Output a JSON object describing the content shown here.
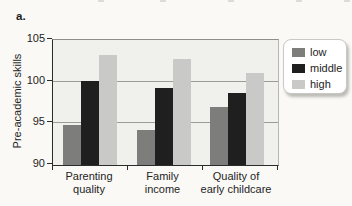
{
  "figure": {
    "panel_label": "a."
  },
  "chart_data": {
    "type": "bar",
    "title": "",
    "xlabel": "",
    "ylabel": "Pre-academic skills",
    "ylim": [
      90,
      105
    ],
    "yticks": [
      90,
      95,
      100,
      105
    ],
    "gridlines": [
      95,
      100
    ],
    "grid": "horizontal",
    "legend_position": "right",
    "plot_bg": "#f0f0ed",
    "categories": [
      "Parenting quality",
      "Family income",
      "Quality of early childcare"
    ],
    "category_label_lines": [
      [
        "Parenting",
        "quality"
      ],
      [
        "Family",
        "income"
      ],
      [
        "Quality of",
        "early childcare"
      ]
    ],
    "series": [
      {
        "name": "low",
        "color": "#7d7d7b",
        "values": [
          94.8,
          94.2,
          97.0
        ]
      },
      {
        "name": "middle",
        "color": "#1f1f1f",
        "values": [
          100.1,
          99.2,
          98.6
        ]
      },
      {
        "name": "high",
        "color": "#c9c9c7",
        "values": [
          103.2,
          102.7,
          101.1
        ]
      }
    ]
  }
}
